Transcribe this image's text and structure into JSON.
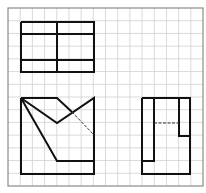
{
  "diagram": {
    "type": "orthographic-projection-exercise",
    "grid": {
      "left": 8,
      "top": 8,
      "right": 203,
      "bottom": 186,
      "cols": 16,
      "rows": 14,
      "line_color": "#d0d0d0",
      "border_color": "#8a8a8a"
    },
    "stroke_color": "#111111",
    "views": [
      {
        "name": "top-view",
        "solid_lines": [
          [
            [
              21,
              22
            ],
            [
              94,
              22
            ],
            [
              94,
              72
            ],
            [
              21,
              72
            ],
            [
              21,
              22
            ]
          ],
          [
            [
              21,
              34
            ],
            [
              94,
              34
            ]
          ],
          [
            [
              21,
              60
            ],
            [
              94,
              60
            ]
          ],
          [
            [
              57,
              22
            ],
            [
              57,
              72
            ]
          ]
        ],
        "dashed_lines": []
      },
      {
        "name": "front-view",
        "solid_lines": [
          [
            [
              21,
              98
            ],
            [
              57,
              98
            ],
            [
              72,
              112
            ]
          ],
          [
            [
              21,
              98
            ],
            [
              21,
              174
            ],
            [
              94,
              174
            ],
            [
              94,
              161
            ],
            [
              57,
              161
            ],
            [
              21,
              98
            ]
          ],
          [
            [
              21,
              98
            ],
            [
              57,
              123
            ],
            [
              94,
              98
            ],
            [
              94,
              174
            ]
          ]
        ],
        "dashed_lines": [
          [
            [
              72,
              112
            ],
            [
              94,
              135
            ]
          ]
        ]
      },
      {
        "name": "side-view",
        "solid_lines": [
          [
            [
              142,
              98
            ],
            [
              190,
              98
            ],
            [
              190,
              174
            ],
            [
              142,
              174
            ],
            [
              142,
              98
            ]
          ],
          [
            [
              154,
              98
            ],
            [
              154,
              161
            ],
            [
              142,
              161
            ]
          ],
          [
            [
              179,
              98
            ],
            [
              179,
              136
            ],
            [
              190,
              136
            ]
          ]
        ],
        "dashed_lines": [
          [
            [
              154,
              123
            ],
            [
              179,
              123
            ]
          ]
        ]
      }
    ]
  }
}
